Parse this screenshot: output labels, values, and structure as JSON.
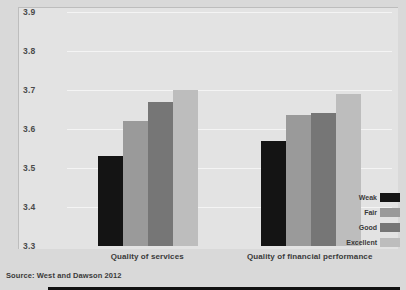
{
  "chart_data": {
    "type": "bar",
    "title": "",
    "subtitle": "",
    "xlabel": "",
    "ylabel": "Average overall engagement score",
    "ylim": [
      3.3,
      3.9
    ],
    "ytick_labels": [
      "3.3",
      "3.4",
      "3.5",
      "3.6",
      "3.7",
      "3.8",
      "3.9"
    ],
    "ytick_values": [
      3.3,
      3.4,
      3.5,
      3.6,
      3.7,
      3.8,
      3.9
    ],
    "grid": true,
    "legend_position": "bottom-right",
    "categories": [
      "Quality of services",
      "Quality of financial performance"
    ],
    "series": [
      {
        "name": "Weak",
        "color": "#141414",
        "values": [
          3.53,
          3.57
        ]
      },
      {
        "name": "Fair",
        "color": "#9a9a9a",
        "values": [
          3.62,
          3.635
        ]
      },
      {
        "name": "Good",
        "color": "#767676",
        "values": [
          3.67,
          3.64
        ]
      },
      {
        "name": "Excellent",
        "color": "#bdbdbd",
        "values": [
          3.7,
          3.69
        ]
      }
    ],
    "source": "Source: West and Dawson 2012"
  },
  "figure": {
    "background_color": "#d9d9d9",
    "plot_background_color": "#e3e3e3",
    "gridline_color": "#f4f4f4",
    "axis_color": "#111111"
  }
}
